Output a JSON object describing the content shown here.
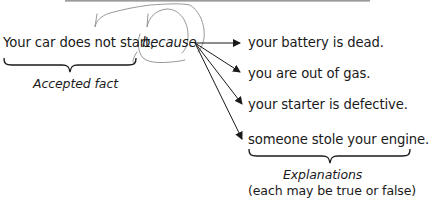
{
  "diagram": {
    "type": "argument-explanation-diagram",
    "premise": {
      "text": "Your car does not start,",
      "connector": "because",
      "label": "Accepted fact"
    },
    "explanations": [
      {
        "text": "your battery is dead."
      },
      {
        "text": "you are out of gas."
      },
      {
        "text": "your starter is defective."
      },
      {
        "text": "someone stole your engine."
      }
    ],
    "explanations_label": "Explanations",
    "explanations_note": "(each may be true or false)",
    "colors": {
      "text": "#1a1a1a",
      "arrows": "#1a1a1a",
      "scribble": "#8c8c8c",
      "top_band": "#9a9a9a"
    }
  }
}
